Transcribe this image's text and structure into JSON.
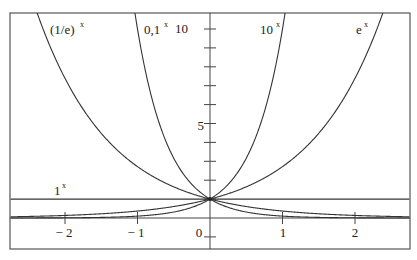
{
  "chart_data": {
    "type": "line",
    "title": "",
    "xlabel": "",
    "ylabel": "",
    "xlim": [
      -2.75,
      2.75
    ],
    "ylim": [
      -1.65,
      10.8
    ],
    "grid": false,
    "legend": "inline labels near curves",
    "x_ticks": [
      -2,
      -1,
      0,
      1,
      2
    ],
    "x_tick_labels": [
      "− 2",
      "− 1",
      "0",
      "1",
      "2"
    ],
    "y_ticks": [
      0,
      1,
      2,
      3,
      4,
      5,
      6,
      7,
      8,
      9,
      10
    ],
    "y_tick_labels": {
      "5": "5",
      "10": "10"
    },
    "series": [
      {
        "name": "(1/e)^x",
        "base_label": "(1/e)",
        "exp_label": "x",
        "base": 0.367879
      },
      {
        "name": "0,1^x",
        "base_label": "0,1",
        "exp_label": "x",
        "base": 0.1
      },
      {
        "name": "10^x",
        "base_label": "10",
        "exp_label": "x",
        "base": 10
      },
      {
        "name": "e^x",
        "base_label": "e",
        "exp_label": "x",
        "base": 2.718282
      },
      {
        "name": "1^x",
        "base_label": "1",
        "exp_label": "x",
        "base": 1
      }
    ],
    "annotations": [
      "All curves pass through (0, 1)"
    ]
  },
  "labels": {
    "one_over_e": {
      "base": "(1/e)",
      "exp": "x"
    },
    "zero_one": {
      "base": "0,1",
      "exp": "x"
    },
    "ten": {
      "base": "10",
      "exp": "x"
    },
    "e": {
      "base": "e",
      "exp": "x"
    },
    "one": {
      "base": "1",
      "exp": "x"
    }
  },
  "axis": {
    "y_label_10": "10",
    "y_label_5": "5",
    "x_label_m2": "− 2",
    "x_label_m1": "− 1",
    "x_label_0": "0",
    "x_label_1": "1",
    "x_label_2": "2"
  },
  "colors": {
    "stroke": "#333333",
    "frame": "#555555",
    "background": "#ffffff"
  }
}
